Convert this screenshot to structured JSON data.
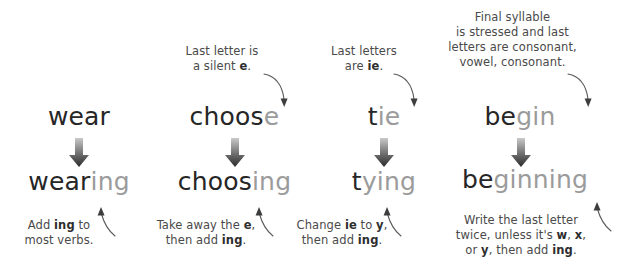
{
  "page": {
    "background_color": "#ffffff",
    "text_color": "#4a4a4a",
    "word_color_dark": "#262626",
    "word_color_dim": "#9b9b9b",
    "arrow_color": "#555555"
  },
  "columns": [
    {
      "id": "wear",
      "top_caption": {
        "lines": []
      },
      "base_word": {
        "stem": "wear",
        "highlight": ""
      },
      "result_word": {
        "stem": "wear",
        "highlight": "ing"
      },
      "bottom_caption": {
        "lines": [
          [
            {
              "t": "Add ",
              "b": false
            },
            {
              "t": "ing",
              "b": true
            },
            {
              "t": " to",
              "b": false
            }
          ],
          [
            {
              "t": "most verbs.",
              "b": false
            }
          ]
        ]
      }
    },
    {
      "id": "choose",
      "top_caption": {
        "lines": [
          [
            {
              "t": "Last letter is",
              "b": false
            }
          ],
          [
            {
              "t": "a silent ",
              "b": false
            },
            {
              "t": "e",
              "b": true
            },
            {
              "t": ".",
              "b": false
            }
          ]
        ]
      },
      "base_word": {
        "stem": "choos",
        "highlight": "e"
      },
      "result_word": {
        "stem": "choos",
        "highlight": "ing"
      },
      "bottom_caption": {
        "lines": [
          [
            {
              "t": "Take away the ",
              "b": false
            },
            {
              "t": "e",
              "b": true
            },
            {
              "t": ",",
              "b": false
            }
          ],
          [
            {
              "t": "then add ",
              "b": false
            },
            {
              "t": "ing",
              "b": true
            },
            {
              "t": ".",
              "b": false
            }
          ]
        ]
      }
    },
    {
      "id": "tie",
      "top_caption": {
        "lines": [
          [
            {
              "t": "Last letters",
              "b": false
            }
          ],
          [
            {
              "t": "are ",
              "b": false
            },
            {
              "t": "ie",
              "b": true
            },
            {
              "t": ".",
              "b": false
            }
          ]
        ]
      },
      "base_word": {
        "stem": "t",
        "highlight": "ie"
      },
      "result_word": {
        "stem": "t",
        "highlight": "ying"
      },
      "bottom_caption": {
        "lines": [
          [
            {
              "t": "Change ",
              "b": false
            },
            {
              "t": "ie",
              "b": true
            },
            {
              "t": " to ",
              "b": false
            },
            {
              "t": "y",
              "b": true
            },
            {
              "t": ",",
              "b": false
            }
          ],
          [
            {
              "t": "then add ",
              "b": false
            },
            {
              "t": "ing",
              "b": true
            },
            {
              "t": ".",
              "b": false
            }
          ]
        ]
      }
    },
    {
      "id": "begin",
      "top_caption": {
        "lines": [
          [
            {
              "t": "Final syllable",
              "b": false
            }
          ],
          [
            {
              "t": "is stressed and last",
              "b": false
            }
          ],
          [
            {
              "t": "letters are consonant,",
              "b": false
            }
          ],
          [
            {
              "t": "vowel, consonant.",
              "b": false
            }
          ]
        ]
      },
      "base_word": {
        "stem": "be",
        "highlight": "gin"
      },
      "result_word": {
        "stem": "be",
        "highlight": "ginning"
      },
      "bottom_caption": {
        "lines": [
          [
            {
              "t": "Write the last letter",
              "b": false
            }
          ],
          [
            {
              "t": "twice, unless it's ",
              "b": false
            },
            {
              "t": "w",
              "b": true
            },
            {
              "t": ", ",
              "b": false
            },
            {
              "t": "x",
              "b": true
            },
            {
              "t": ",",
              "b": false
            }
          ],
          [
            {
              "t": "or ",
              "b": false
            },
            {
              "t": "y",
              "b": true
            },
            {
              "t": ", then add ",
              "b": false
            },
            {
              "t": "ing",
              "b": true
            },
            {
              "t": ".",
              "b": false
            }
          ]
        ]
      }
    }
  ],
  "icons": {
    "transform_arrow": "down-arrow-icon",
    "pointer_top": "curved-arrow-down-icon",
    "pointer_bottom": "curved-arrow-up-icon"
  }
}
